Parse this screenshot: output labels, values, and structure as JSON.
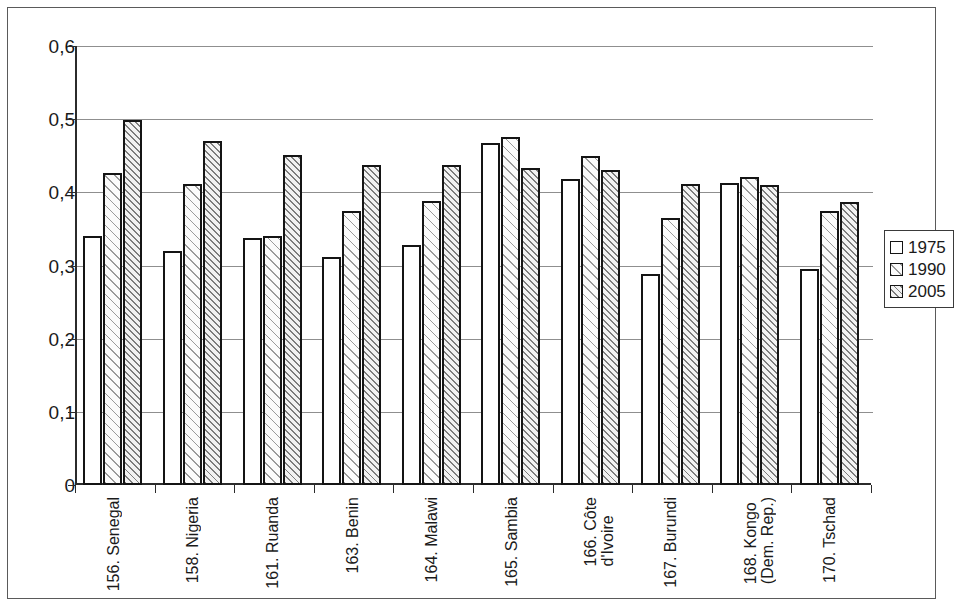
{
  "chart_data": {
    "type": "bar",
    "title": "",
    "xlabel": "",
    "ylabel": "",
    "ylim": [
      0,
      0.6
    ],
    "ytick_labels": [
      "0,6",
      "0,5",
      "0,4",
      "0,3",
      "0,2",
      "0,1",
      "0"
    ],
    "ytick_values": [
      0.6,
      0.5,
      0.4,
      0.3,
      0.2,
      0.1,
      0
    ],
    "grid": true,
    "legend_position": "right",
    "decimal_separator": ",",
    "categories": [
      "156. Senegal",
      "158. Nigeria",
      "161. Ruanda",
      "163. Benin",
      "164. Malawi",
      "165. Sambia",
      "166. Côte\nd'Ivoire",
      "167. Burundi",
      "168. Kongo\n(Dem. Rep.)",
      "170. Tschad"
    ],
    "series": [
      {
        "name": "1975",
        "values": [
          0.34,
          0.32,
          0.337,
          0.312,
          0.328,
          0.468,
          0.418,
          0.289,
          0.413,
          0.295
        ]
      },
      {
        "name": "1990",
        "values": [
          0.426,
          0.411,
          0.34,
          0.374,
          0.388,
          0.476,
          0.449,
          0.365,
          0.421,
          0.375
        ]
      },
      {
        "name": "2005",
        "values": [
          0.499,
          0.47,
          0.451,
          0.437,
          0.437,
          0.433,
          0.431,
          0.412,
          0.41,
          0.387
        ]
      }
    ],
    "legend": [
      {
        "label": "1975",
        "pattern": "solid-white"
      },
      {
        "label": "1990",
        "pattern": "light-diagonal-hatch"
      },
      {
        "label": "2005",
        "pattern": "dense-diagonal-hatch"
      }
    ],
    "colors": {
      "bar_outline": "#141414",
      "gridline": "#8f8f8f",
      "axis": "#2b2b2b",
      "text": "#1a1a1a",
      "background": "#ffffff"
    }
  }
}
